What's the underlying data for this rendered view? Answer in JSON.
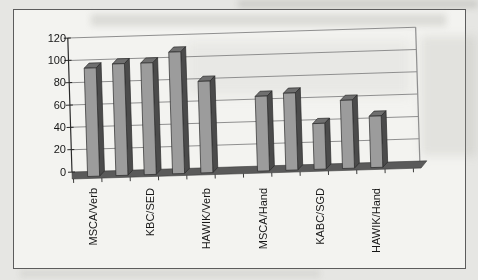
{
  "figure": {
    "page_color": "#e6e6e3",
    "paper_color": "#f3f3f0",
    "border_color": "#5c5c5c"
  },
  "chart_data": {
    "type": "bar",
    "bar_style": "3d-column",
    "title": "",
    "xlabel": "",
    "ylabel": "",
    "categories": [
      "MSCA/Verb",
      "",
      "KBC/SED",
      "",
      "HAWIK/Verb",
      "",
      "MSCA/Hand",
      "",
      "KABC/SGD",
      "",
      "HAWIK/Hand",
      ""
    ],
    "values": [
      97,
      100,
      100,
      109,
      82,
      null,
      67,
      69,
      41,
      61,
      46,
      null
    ],
    "visible_category_labels": [
      "MSCA/Verb",
      "KBC/SED",
      "HAWIK/Verb",
      "MSCA/Hand",
      "KABC/SGD",
      "HAWIK/Hand"
    ],
    "yticks": [
      0,
      20,
      40,
      60,
      80,
      100,
      120
    ],
    "ylim": [
      0,
      120
    ],
    "grid": true,
    "legend": "none",
    "gridline_color": "#8f8f8f",
    "axis_color": "#2a2a2a",
    "label_color": "#161616",
    "floor_color": "#5a5a5a",
    "bar_colors": {
      "front": "#9c9c9c",
      "top": "#6f6f6f",
      "side": "#4b4b4b",
      "outline": "#2b2b2b"
    }
  }
}
